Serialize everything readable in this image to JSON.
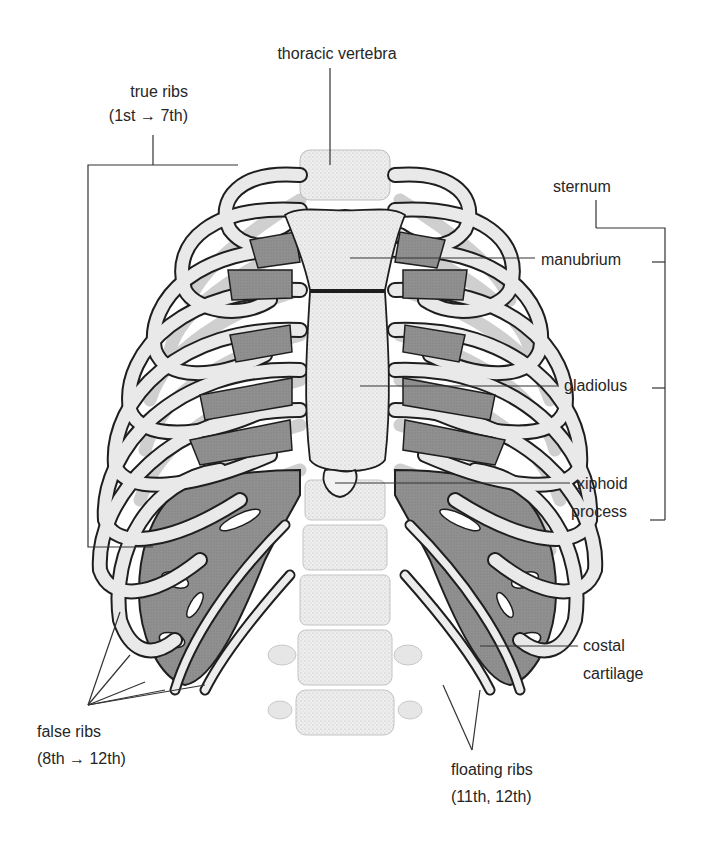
{
  "diagram": {
    "colors": {
      "background": "#ffffff",
      "bone": "#ececec",
      "bone_shade": "#bdbdbd",
      "cartilage": "#8f8f8f",
      "outline": "#1e1e1e",
      "leader_line": "#333333",
      "text": "#262626"
    },
    "labels": {
      "thoracic_vertebra": "thoracic vertebra",
      "true_ribs_line1": "true ribs",
      "true_ribs_line2": "(1st → 7th)",
      "sternum": "sternum",
      "manubrium": "manubrium",
      "gladiolus": "gladiolus",
      "xiphoid_line1": "xiphoid",
      "xiphoid_line2": "process",
      "costal_line1": "costal",
      "costal_line2": "cartilage",
      "false_ribs_line1": "false ribs",
      "false_ribs_line2": "(8th → 12th)",
      "floating_ribs_line1": "floating ribs",
      "floating_ribs_line2": "(11th, 12th)"
    }
  }
}
